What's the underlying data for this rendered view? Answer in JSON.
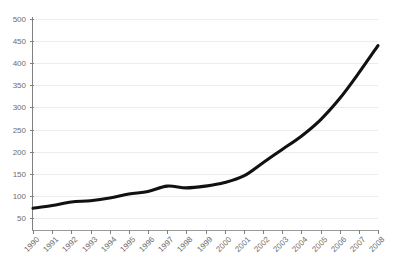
{
  "chart_data": {
    "type": "line",
    "title": "",
    "clipped_header_text": "",
    "xlabel": "",
    "ylabel": "",
    "categories": [
      "1990",
      "1991",
      "1992",
      "1993",
      "1994",
      "1995",
      "1996",
      "1997",
      "1998",
      "1999",
      "2000",
      "2001",
      "2002",
      "2003",
      "2004",
      "2005",
      "2006",
      "2007",
      "2008"
    ],
    "values": [
      72,
      78,
      86,
      89,
      95,
      104,
      110,
      122,
      118,
      122,
      130,
      145,
      175,
      205,
      235,
      272,
      320,
      378,
      440
    ],
    "series": [
      {
        "name": "",
        "values": [
          72,
          78,
          86,
          89,
          95,
          104,
          110,
          122,
          118,
          122,
          130,
          145,
          175,
          205,
          235,
          272,
          320,
          378,
          440
        ]
      }
    ],
    "ylim": [
      25,
      500
    ],
    "yticks": [
      50,
      100,
      150,
      200,
      250,
      300,
      350,
      400,
      450,
      500
    ],
    "ytick_labels": [
      "50",
      "100",
      "150",
      "200",
      "250",
      "300",
      "350",
      "400",
      "450",
      "500"
    ],
    "xtick_labels": [
      "1990",
      "1991",
      "1992",
      "1993",
      "1994",
      "1995",
      "1996",
      "1997",
      "1998",
      "1999",
      "2000",
      "2001",
      "2002",
      "2003",
      "2004",
      "2005",
      "2006",
      "2007",
      "2008"
    ],
    "grid": true,
    "grid_axis": "y",
    "legend": false,
    "legend_position": "none",
    "line_color": "#111111",
    "grid_color": "#ececec",
    "axis_color": "#808080",
    "tick_label_color": "#6d6d6d",
    "background_color": "#ffffff",
    "xtick_rotation": -45
  }
}
